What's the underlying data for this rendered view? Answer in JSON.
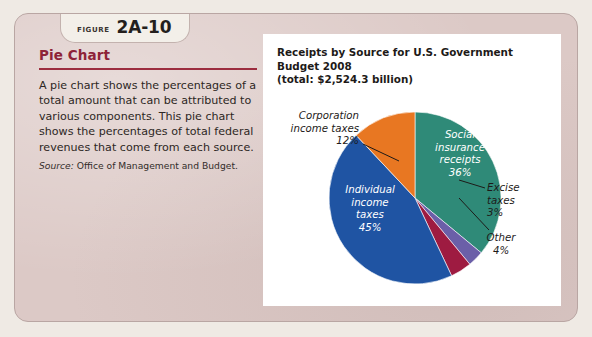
{
  "figure": {
    "label_word": "Figure",
    "number": "2A-10"
  },
  "left": {
    "heading": "Pie Chart",
    "description": "A pie chart shows the percentages of a total amount that can be attributed to various components. This pie chart shows the percentages of total federal revenues that come from each source.",
    "source_label": "Source:",
    "source_text": " Office of Management and Budget."
  },
  "chart_data": {
    "type": "pie",
    "title": "Receipts by Source for U.S. Government Budget 2008\n(total: $2,524.3 billion)",
    "title_line1": "Receipts by Source for U.S. Government Budget 2008",
    "title_line2": "(total: $2,524.3 billion)",
    "total": "$2,524.3 billion",
    "year": "2008",
    "categories": [
      "Social insurance receipts",
      "Excise taxes",
      "Other",
      "Individual income taxes",
      "Corporation income taxes"
    ],
    "values": [
      36,
      3,
      4,
      45,
      12
    ],
    "colors": [
      "#2f8a78",
      "#6b5fa8",
      "#9e1b41",
      "#1f54a3",
      "#e87722"
    ],
    "label_placement": [
      "inside",
      "outside",
      "outside",
      "inside",
      "outside"
    ],
    "slices": [
      {
        "name": "Social insurance receipts",
        "value": 36,
        "label": "Social\ninsurance\nreceipts\n36%",
        "percent": "36%",
        "color": "#2f8a78"
      },
      {
        "name": "Excise taxes",
        "value": 3,
        "label": "Excise\ntaxes\n3%",
        "percent": "3%",
        "color": "#6b5fa8"
      },
      {
        "name": "Other",
        "value": 4,
        "label": "Other\n4%",
        "percent": "4%",
        "color": "#9e1b41"
      },
      {
        "name": "Individual income taxes",
        "value": 45,
        "label": "Individual\nincome\ntaxes\n45%",
        "percent": "45%",
        "color": "#1f54a3"
      },
      {
        "name": "Corporation income taxes",
        "value": 12,
        "label": "Corporation\nincome taxes\n12%",
        "percent": "12%",
        "color": "#e87722"
      }
    ],
    "legend": "none",
    "grid": false,
    "start_angle_deg": 0,
    "direction": "clockwise"
  },
  "theme": {
    "panel_bg": "#dcc9c6",
    "page_bg": "#efeae4",
    "heading_color": "#8e2338",
    "rule_color": "#9c2d3f",
    "card_bg": "#ffffff"
  }
}
